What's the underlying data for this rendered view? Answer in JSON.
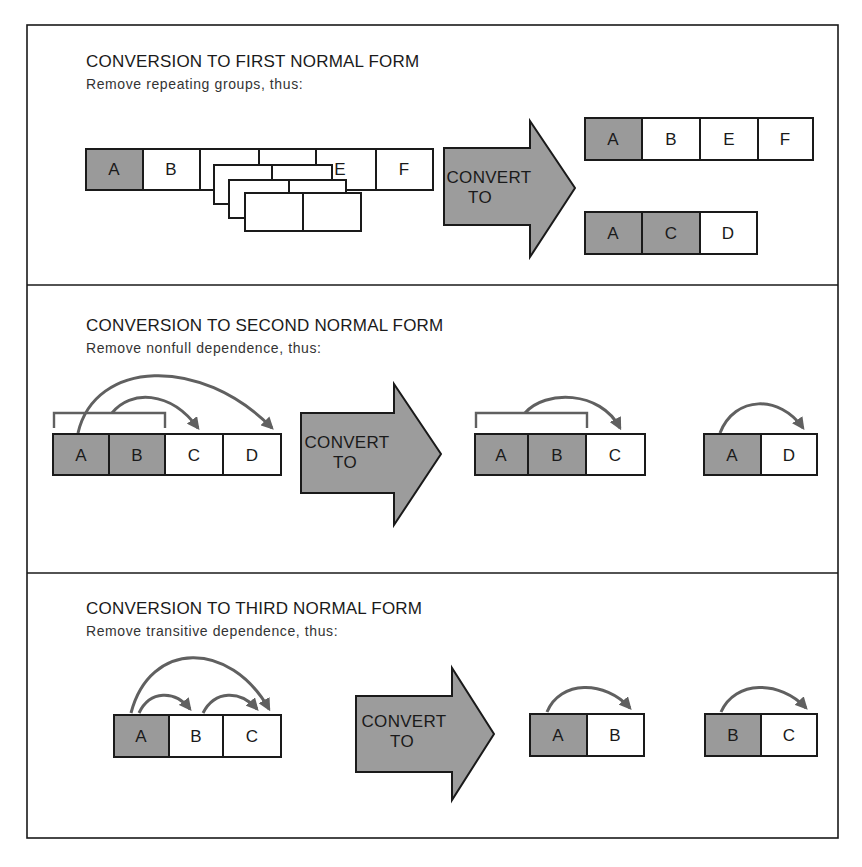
{
  "figure": {
    "sections": [
      {
        "id": "first-normal-form",
        "title": "CONVERSION TO FIRST NORMAL FORM",
        "subtitle": "Remove repeating groups, thus:",
        "arrow": {
          "line1": "CONVERT",
          "line2": "TO"
        },
        "before": {
          "cells": [
            {
              "label": "A",
              "key": true
            },
            {
              "label": "B",
              "key": false
            },
            {
              "label": "",
              "key": false
            },
            {
              "label": "",
              "key": false
            },
            {
              "label": "E",
              "key": false
            },
            {
              "label": "F",
              "key": false
            }
          ],
          "repeating_group_note": "cells 3-4 (C, D) repeated as stacked groups"
        },
        "after": [
          {
            "cells": [
              {
                "label": "A",
                "key": true
              },
              {
                "label": "B",
                "key": false
              },
              {
                "label": "E",
                "key": false
              },
              {
                "label": "F",
                "key": false
              }
            ]
          },
          {
            "cells": [
              {
                "label": "A",
                "key": true
              },
              {
                "label": "C",
                "key": true
              },
              {
                "label": "D",
                "key": false
              }
            ]
          }
        ]
      },
      {
        "id": "second-normal-form",
        "title": "CONVERSION TO SECOND NORMAL FORM",
        "subtitle": "Remove nonfull dependence, thus:",
        "arrow": {
          "line1": "CONVERT",
          "line2": "TO"
        },
        "before": {
          "cells": [
            {
              "label": "A",
              "key": true
            },
            {
              "label": "B",
              "key": true
            },
            {
              "label": "C",
              "key": false
            },
            {
              "label": "D",
              "key": false
            }
          ],
          "dependencies": [
            {
              "from": "A+B",
              "to": "C"
            },
            {
              "from": "A",
              "to": "D"
            }
          ]
        },
        "after": [
          {
            "cells": [
              {
                "label": "A",
                "key": true
              },
              {
                "label": "B",
                "key": true
              },
              {
                "label": "C",
                "key": false
              }
            ],
            "dependencies": [
              {
                "from": "A+B",
                "to": "C"
              }
            ]
          },
          {
            "cells": [
              {
                "label": "A",
                "key": true
              },
              {
                "label": "D",
                "key": false
              }
            ],
            "dependencies": [
              {
                "from": "A",
                "to": "D"
              }
            ]
          }
        ]
      },
      {
        "id": "third-normal-form",
        "title": "CONVERSION TO THIRD NORMAL FORM",
        "subtitle": "Remove transitive dependence, thus:",
        "arrow": {
          "line1": "CONVERT",
          "line2": "TO"
        },
        "before": {
          "cells": [
            {
              "label": "A",
              "key": true
            },
            {
              "label": "B",
              "key": false
            },
            {
              "label": "C",
              "key": false
            }
          ],
          "dependencies": [
            {
              "from": "A",
              "to": "B"
            },
            {
              "from": "A",
              "to": "C"
            },
            {
              "from": "B",
              "to": "C"
            }
          ]
        },
        "after": [
          {
            "cells": [
              {
                "label": "A",
                "key": true
              },
              {
                "label": "B",
                "key": false
              }
            ],
            "dependencies": [
              {
                "from": "A",
                "to": "B"
              }
            ]
          },
          {
            "cells": [
              {
                "label": "B",
                "key": true
              },
              {
                "label": "C",
                "key": false
              }
            ],
            "dependencies": [
              {
                "from": "B",
                "to": "C"
              }
            ]
          }
        ]
      }
    ],
    "colors": {
      "key_cell": "#9a9a9a",
      "plain_cell": "#ffffff",
      "arrow_fill": "#9c9c9c",
      "dependency_line": "#606060",
      "outline": "#1a1a1a"
    }
  }
}
